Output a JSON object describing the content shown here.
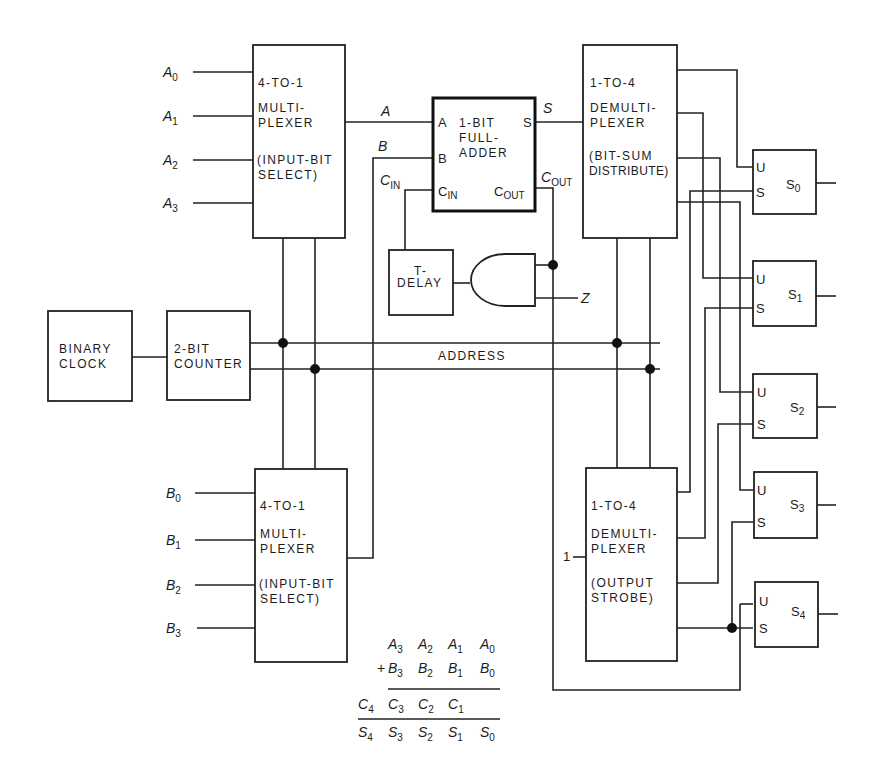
{
  "diagram": {
    "title_hint": "Serial 4-bit binary adder block diagram",
    "input_a_labels": [
      {
        "name": "A",
        "sub": "0"
      },
      {
        "name": "A",
        "sub": "1"
      },
      {
        "name": "A",
        "sub": "2"
      },
      {
        "name": "A",
        "sub": "3"
      }
    ],
    "input_b_labels": [
      {
        "name": "B",
        "sub": "0"
      },
      {
        "name": "B",
        "sub": "1"
      },
      {
        "name": "B",
        "sub": "2"
      },
      {
        "name": "B",
        "sub": "3"
      }
    ],
    "mux_a": {
      "line1": "4-TO-1",
      "line2": "MULTI-",
      "line3": "PLEXER",
      "line4": "(INPUT-BIT",
      "line5": "SELECT)"
    },
    "mux_b": {
      "line1": "4-TO-1",
      "line2": "MULTI-",
      "line3": "PLEXER",
      "line4": "(INPUT-BIT",
      "line5": "SELECT)"
    },
    "full_adder": {
      "line1": "1-BIT",
      "line2": "FULL-",
      "line3": "ADDER",
      "pin_a": "A",
      "pin_b": "B",
      "pin_s": "S",
      "pin_cin_main": "C",
      "pin_cin_sub": "IN",
      "pin_cout_main": "C",
      "pin_cout_sub": "OUT"
    },
    "wire_labels": {
      "a": "A",
      "b": "B",
      "s": "S",
      "cin_main": "C",
      "cin_sub": "IN",
      "cout_main": "C",
      "cout_sub": "OUT",
      "z": "Z",
      "address": "ADDRESS",
      "strobe_input": "1"
    },
    "demux_sum": {
      "line1": "1-TO-4",
      "line2": "DEMULTI-",
      "line3": "PLEXER",
      "line4": "(BIT-SUM",
      "line5": "DISTRIBUTE)"
    },
    "demux_strobe": {
      "line1": "1-TO-4",
      "line2": "DEMULTI-",
      "line3": "PLEXER",
      "line4": "(OUTPUT",
      "line5": "STROBE)"
    },
    "delay": {
      "line1": "T-",
      "line2": "DELAY"
    },
    "clock": {
      "line1": "BINARY",
      "line2": "CLOCK"
    },
    "counter": {
      "line1": "2-BIT",
      "line2": "COUNTER"
    },
    "registers": [
      {
        "pin_u": "U",
        "pin_s": "S",
        "name": "S",
        "sub": "0"
      },
      {
        "pin_u": "U",
        "pin_s": "S",
        "name": "S",
        "sub": "1"
      },
      {
        "pin_u": "U",
        "pin_s": "S",
        "name": "S",
        "sub": "2"
      },
      {
        "pin_u": "U",
        "pin_s": "S",
        "name": "S",
        "sub": "3"
      },
      {
        "pin_u": "U",
        "pin_s": "S",
        "name": "S",
        "sub": "4"
      }
    ],
    "equation": {
      "row1": [
        {
          "name": "A",
          "sub": "3"
        },
        {
          "name": "A",
          "sub": "2"
        },
        {
          "name": "A",
          "sub": "1"
        },
        {
          "name": "A",
          "sub": "0"
        }
      ],
      "plus": "+",
      "row2": [
        {
          "name": "B",
          "sub": "3"
        },
        {
          "name": "B",
          "sub": "2"
        },
        {
          "name": "B",
          "sub": "1"
        },
        {
          "name": "B",
          "sub": "0"
        }
      ],
      "row3": [
        {
          "name": "C",
          "sub": "4"
        },
        {
          "name": "C",
          "sub": "3"
        },
        {
          "name": "C",
          "sub": "2"
        },
        {
          "name": "C",
          "sub": "1"
        }
      ],
      "row4": [
        {
          "name": "S",
          "sub": "4"
        },
        {
          "name": "S",
          "sub": "3"
        },
        {
          "name": "S",
          "sub": "2"
        },
        {
          "name": "S",
          "sub": "1"
        },
        {
          "name": "S",
          "sub": "0"
        }
      ]
    }
  }
}
